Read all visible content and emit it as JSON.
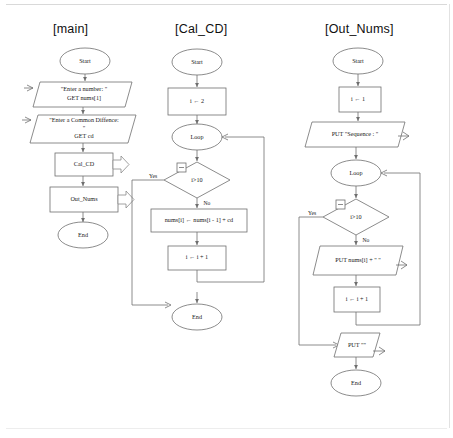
{
  "document": {
    "kind": "flowchart-diagram",
    "panel_count": 3
  },
  "panels": [
    {
      "title": "[main]",
      "nodes": [
        {
          "id": "main-start",
          "type": "terminator",
          "label": "Start"
        },
        {
          "id": "main-in1",
          "type": "input",
          "label_line1": "\"Enter a number: \"",
          "label_line2": "GET nums[1]"
        },
        {
          "id": "main-in2",
          "type": "input",
          "label_line1": "\"Enter a Common Diffence:",
          "label_line2": "\"",
          "label_line3": "GET cd"
        },
        {
          "id": "main-call1",
          "type": "subroutine",
          "label": "Cal_CD"
        },
        {
          "id": "main-call2",
          "type": "subroutine",
          "label": "Out_Nums"
        },
        {
          "id": "main-end",
          "type": "terminator",
          "label": "End"
        }
      ]
    },
    {
      "title": "[Cal_CD]",
      "nodes": [
        {
          "id": "cal-start",
          "type": "terminator",
          "label": "Start"
        },
        {
          "id": "cal-init",
          "type": "process",
          "label": "i ← 2"
        },
        {
          "id": "cal-loop",
          "type": "loop",
          "label": "Loop"
        },
        {
          "id": "cal-cond",
          "type": "decision",
          "label": "i>10"
        },
        {
          "id": "cal-body",
          "type": "process",
          "label": "nums[i] ← nums[i - 1] + cd"
        },
        {
          "id": "cal-incr",
          "type": "process",
          "label": "i ← i + 1"
        },
        {
          "id": "cal-end",
          "type": "terminator",
          "label": "End"
        }
      ],
      "edge_labels": {
        "yes": "Yes",
        "no": "No"
      }
    },
    {
      "title": "[Out_Nums]",
      "nodes": [
        {
          "id": "out-start",
          "type": "terminator",
          "label": "Start"
        },
        {
          "id": "out-init",
          "type": "process",
          "label": "i ← 1"
        },
        {
          "id": "out-head",
          "type": "output",
          "label": "PUT \"Sequence : \""
        },
        {
          "id": "out-loop",
          "type": "loop",
          "label": "Loop"
        },
        {
          "id": "out-cond",
          "type": "decision",
          "label": "i>10"
        },
        {
          "id": "out-print",
          "type": "output",
          "label": "PUT nums[i] + \" \""
        },
        {
          "id": "out-incr",
          "type": "process",
          "label": "i ← i + 1"
        },
        {
          "id": "out-nl",
          "type": "output",
          "label": "PUT \"\""
        },
        {
          "id": "out-end",
          "type": "terminator",
          "label": "End"
        }
      ],
      "edge_labels": {
        "yes": "Yes",
        "no": "No"
      }
    }
  ],
  "colors": {
    "background": "#ffffff",
    "stroke": "#6e6e6e",
    "text": "#1a1a1a",
    "frame": "#d9d9d9"
  }
}
